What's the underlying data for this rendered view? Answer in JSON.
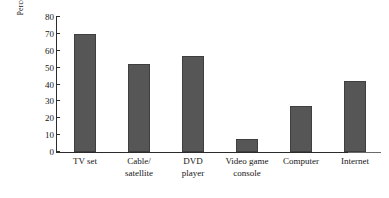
{
  "chart_data": {
    "type": "bar",
    "title": "",
    "xlabel": "",
    "ylabel": "Percentage of parents",
    "categories": [
      "TV set",
      "Cable/ satellite",
      "DVD player",
      "Video game console",
      "Computer",
      "Internet"
    ],
    "category_lines": [
      [
        "TV set"
      ],
      [
        "Cable/",
        "satellite"
      ],
      [
        "DVD",
        "player"
      ],
      [
        "Video game",
        "console"
      ],
      [
        "Computer"
      ],
      [
        "Internet"
      ]
    ],
    "values": [
      70,
      52,
      57,
      8,
      27,
      42
    ],
    "ylim": [
      0,
      80
    ],
    "ytick_values": [
      0,
      10,
      20,
      30,
      40,
      50,
      60,
      70,
      80
    ],
    "ytick_labels": [
      "0",
      "10",
      "20",
      "30",
      "40",
      "50",
      "60",
      "70",
      "80"
    ],
    "grid": false,
    "legend": false,
    "bar_color": "#565656",
    "bar_edge_color": "#3f3f3f",
    "axis_color": "#2b2b2b",
    "background": "#ffffff"
  }
}
